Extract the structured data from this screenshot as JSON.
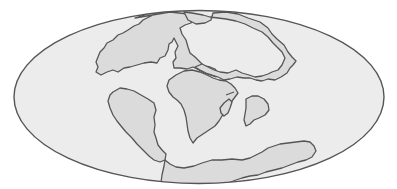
{
  "diagram": {
    "type": "paleogeographic-world-map",
    "projection": "elliptical (Mollweide-style)",
    "labels": [],
    "colors": {
      "background": "#ffffff",
      "ocean": "#ececec",
      "land": "#dbdbdb",
      "outline": "#555555"
    },
    "landmasses": [
      {
        "name": "north-america-laurentia"
      },
      {
        "name": "eurasia"
      },
      {
        "name": "africa"
      },
      {
        "name": "south-america"
      },
      {
        "name": "india"
      },
      {
        "name": "madagascar"
      },
      {
        "name": "antarctica-australia"
      }
    ]
  }
}
